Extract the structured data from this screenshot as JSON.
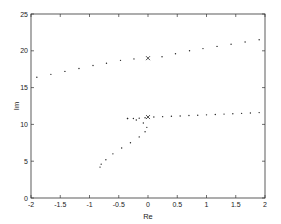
{
  "chart_data": {
    "type": "scatter",
    "title": "",
    "xlabel": "Re",
    "ylabel": "Im",
    "xlim": [
      -2,
      2
    ],
    "ylim": [
      0,
      25
    ],
    "xticks": [
      "-2",
      "-1.5",
      "-1",
      "-0.5",
      "0",
      "0.5",
      "1",
      "1.5",
      "2"
    ],
    "yticks": [
      "0",
      "5",
      "10",
      "15",
      "20",
      "25"
    ],
    "grid": false,
    "legend": null,
    "series": [
      {
        "name": "upper branch",
        "marker": "dot",
        "x": [
          -1.9,
          -1.66,
          -1.42,
          -1.18,
          -0.94,
          -0.71,
          -0.47,
          -0.24,
          0.24,
          0.47,
          0.71,
          0.94,
          1.18,
          1.42,
          1.66,
          1.9
        ],
        "y": [
          16.4,
          16.8,
          17.2,
          17.6,
          18.0,
          18.3,
          18.7,
          18.9,
          19.2,
          19.6,
          20.0,
          20.3,
          20.6,
          20.9,
          21.2,
          21.5
        ]
      },
      {
        "name": "upper marker",
        "marker": "x",
        "x": [
          0
        ],
        "y": [
          19.0
        ]
      },
      {
        "name": "lower branch (horizontal)",
        "marker": "dot",
        "x": [
          -0.35,
          -0.25,
          -0.15,
          -0.05,
          0.1,
          0.25,
          0.4,
          0.55,
          0.7,
          0.85,
          1.0,
          1.15,
          1.3,
          1.45,
          1.6,
          1.75,
          1.9
        ],
        "y": [
          10.8,
          10.8,
          10.85,
          10.9,
          11.0,
          11.05,
          11.1,
          11.15,
          11.2,
          11.25,
          11.3,
          11.35,
          11.4,
          11.45,
          11.5,
          11.55,
          11.6
        ]
      },
      {
        "name": "lower marker",
        "marker": "x",
        "x": [
          0
        ],
        "y": [
          11.0
        ]
      },
      {
        "name": "lower branch (curve)",
        "marker": "dot",
        "x": [
          -0.35,
          -0.2,
          -0.08,
          -0.02,
          -0.05,
          -0.15,
          -0.3,
          -0.45,
          -0.6,
          -0.72,
          -0.8,
          -0.82
        ],
        "y": [
          10.8,
          10.6,
          10.2,
          9.6,
          9.0,
          8.3,
          7.5,
          6.8,
          6.0,
          5.2,
          4.6,
          4.2
        ]
      }
    ]
  }
}
